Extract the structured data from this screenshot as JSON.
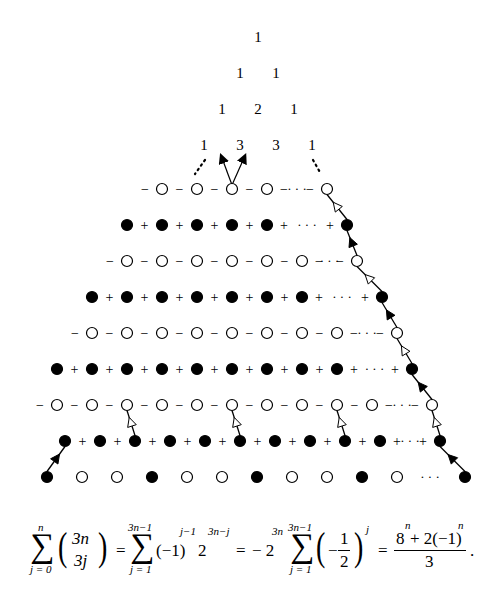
{
  "figure": {
    "pascal_rows": [
      [
        "1"
      ],
      [
        "1",
        "1"
      ],
      [
        "1",
        "2",
        "1"
      ],
      [
        "1",
        "3",
        "3",
        "1"
      ]
    ],
    "colors": {
      "ink": "#000000",
      "background": "#ffffff",
      "open_node_fill": "#ffffff",
      "filled_node_fill": "#000000"
    },
    "lattice_rows": [
      {
        "y": 189,
        "kind": "open",
        "sign": "−",
        "xs": [
          162,
          197,
          232,
          267
        ],
        "right_x": 327,
        "lead_sign": true,
        "ellipsis": "· · ·"
      },
      {
        "y": 225,
        "kind": "filled",
        "sign": "+",
        "xs": [
          127,
          162,
          197,
          232,
          267
        ],
        "right_x": 347,
        "lead_sign": false,
        "ellipsis": "· · ·"
      },
      {
        "y": 261,
        "kind": "open",
        "sign": "−",
        "xs": [
          127,
          162,
          197,
          232,
          267,
          302
        ],
        "right_x": 357,
        "lead_sign": true,
        "ellipsis": "· · ·"
      },
      {
        "y": 297,
        "kind": "filled",
        "sign": "+",
        "xs": [
          92,
          127,
          162,
          197,
          232,
          267,
          302
        ],
        "right_x": 382,
        "lead_sign": false,
        "ellipsis": "· · ·"
      },
      {
        "y": 333,
        "kind": "open",
        "sign": "−",
        "xs": [
          92,
          127,
          162,
          197,
          232,
          267,
          302,
          337
        ],
        "right_x": 397,
        "lead_sign": true,
        "ellipsis": "· · ·"
      },
      {
        "y": 369,
        "kind": "filled",
        "sign": "+",
        "xs": [
          57,
          92,
          127,
          162,
          197,
          232,
          267,
          302,
          337
        ],
        "right_x": 412,
        "lead_sign": false,
        "ellipsis": "· · ·"
      },
      {
        "y": 405,
        "kind": "open",
        "sign": "−",
        "xs": [
          57,
          92,
          127,
          162,
          197,
          232,
          267,
          302,
          337,
          372
        ],
        "right_x": 432,
        "lead_sign": true,
        "ellipsis": "· · ·"
      },
      {
        "y": 441,
        "kind": "filled",
        "sign": "+",
        "xs": [
          65,
          100,
          135,
          170,
          205,
          240,
          275,
          310,
          345,
          380
        ],
        "right_x": 440,
        "lead_sign": false,
        "ellipsis": "· · ·"
      },
      {
        "y": 477,
        "kind": "bottom",
        "sign": "",
        "items": [
          {
            "x": 47,
            "t": "f"
          },
          {
            "x": 82,
            "t": "o"
          },
          {
            "x": 117,
            "t": "o"
          },
          {
            "x": 152,
            "t": "f"
          },
          {
            "x": 187,
            "t": "o"
          },
          {
            "x": 222,
            "t": "o"
          },
          {
            "x": 257,
            "t": "f"
          },
          {
            "x": 292,
            "t": "o"
          },
          {
            "x": 327,
            "t": "o"
          },
          {
            "x": 362,
            "t": "f"
          },
          {
            "x": 397,
            "t": "o"
          },
          {
            "x": 465,
            "t": "f"
          }
        ],
        "ellipsis": "· · ·",
        "ellipsis_x": 430
      }
    ],
    "formula": {
      "lhs_sum_upper": "n",
      "lhs_sum_lower": "j = 0",
      "lhs_binom_top": "3n",
      "lhs_binom_bottom": "3j",
      "eq1": "=",
      "sum2_upper": "3n−1",
      "sum2_lower": "j = 1",
      "term2": "(−1)",
      "term2_exp": "j−1",
      "term2_base": "2",
      "term2_base_exp": "3n−j",
      "eq2": "=",
      "term3_prefix": "− 2",
      "term3_prefix_exp": "3n",
      "sum3_upper": "3n−1",
      "sum3_lower": "j = 1",
      "term3_minus": "−",
      "term3_num": "1",
      "term3_den": "2",
      "term3_exp": "j",
      "eq3": "=",
      "result_num": "8",
      "result_num_exp": "n",
      "result_num_rest": " + 2(−1)",
      "result_num_rest_exp": "n",
      "result_den": "3",
      "period": "."
    }
  }
}
